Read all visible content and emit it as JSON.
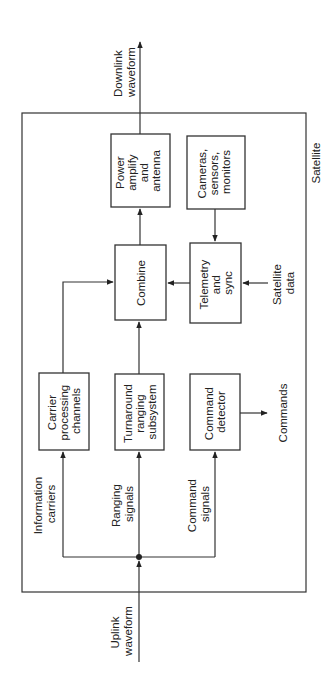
{
  "diagram": {
    "orientation": "rotated -90deg (reads bottom-to-top)",
    "container_label": "Satellite",
    "blocks": {
      "power": [
        "Power",
        "amplify",
        "and",
        "antenna"
      ],
      "cameras": [
        "Cameras,",
        "sensors,",
        "monitors"
      ],
      "combine": [
        "Combine"
      ],
      "telemetry": [
        "Telemetry",
        "and",
        "sync"
      ],
      "carrier": [
        "Carrier",
        "processing",
        "channels"
      ],
      "turnaround": [
        "Turnaround",
        "ranging",
        "subsystem"
      ],
      "command": [
        "Command",
        "detector"
      ]
    },
    "labels": {
      "downlink": [
        "Downlink",
        "waveform"
      ],
      "uplink": [
        "Uplink",
        "waveform"
      ],
      "info": [
        "Information",
        "carriers"
      ],
      "ranging": [
        "Ranging",
        "signals"
      ],
      "cmdsig": [
        "Command",
        "signals"
      ],
      "satdata": [
        "Satellite",
        "data"
      ],
      "commands": [
        "Commands"
      ]
    },
    "connections": [
      {
        "from": "Uplink waveform",
        "to": "junction"
      },
      {
        "from": "junction",
        "to": "Carrier processing channels",
        "label": "Information carriers"
      },
      {
        "from": "junction",
        "to": "Turnaround ranging subsystem",
        "label": "Ranging signals"
      },
      {
        "from": "junction",
        "to": "Command detector",
        "label": "Command signals"
      },
      {
        "from": "Carrier processing channels",
        "to": "Combine"
      },
      {
        "from": "Turnaround ranging subsystem",
        "to": "Combine"
      },
      {
        "from": "Telemetry and sync",
        "to": "Combine"
      },
      {
        "from": "Cameras, sensors, monitors",
        "to": "Telemetry and sync"
      },
      {
        "from": "Satellite data",
        "to": "Telemetry and sync"
      },
      {
        "from": "Command detector",
        "to": "Commands"
      },
      {
        "from": "Combine",
        "to": "Power amplify and antenna"
      },
      {
        "from": "Power amplify and antenna",
        "to": "Downlink waveform"
      }
    ]
  }
}
